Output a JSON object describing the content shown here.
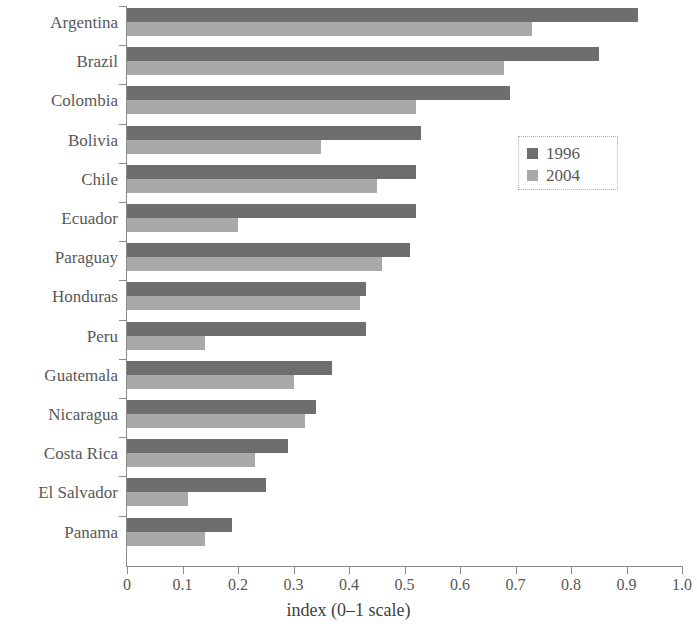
{
  "chart_data": {
    "type": "bar",
    "orientation": "horizontal",
    "title": "",
    "xlabel": "index (0–1 scale)",
    "ylabel": "",
    "xlim": [
      0,
      1.0
    ],
    "grid": false,
    "legend_position": "right-upper",
    "x_ticks": [
      "0",
      "0.1",
      "0.2",
      "0.3",
      "0.4",
      "0.5",
      "0.6",
      "0.7",
      "0.8",
      "0.9",
      "1.0"
    ],
    "x_tick_values": [
      0,
      0.1,
      0.2,
      0.3,
      0.4,
      0.5,
      0.6,
      0.7,
      0.8,
      0.9,
      1.0
    ],
    "categories": [
      "Argentina",
      "Brazil",
      "Colombia",
      "Bolivia",
      "Chile",
      "Ecuador",
      "Paraguay",
      "Honduras",
      "Peru",
      "Guatemala",
      "Nicaragua",
      "Costa Rica",
      "El Salvador",
      "Panama"
    ],
    "series": [
      {
        "name": "1996",
        "color": "#6e6e6e",
        "values": [
          0.92,
          0.85,
          0.69,
          0.53,
          0.52,
          0.52,
          0.51,
          0.43,
          0.43,
          0.37,
          0.34,
          0.29,
          0.25,
          0.19
        ]
      },
      {
        "name": "2004",
        "color": "#a9a9a9",
        "values": [
          0.73,
          0.68,
          0.52,
          0.35,
          0.45,
          0.2,
          0.46,
          0.42,
          0.14,
          0.3,
          0.32,
          0.23,
          0.11,
          0.14
        ]
      }
    ]
  },
  "legend": {
    "entries": [
      {
        "label": "1996",
        "color": "#6e6e6e"
      },
      {
        "label": "2004",
        "color": "#a9a9a9"
      }
    ]
  },
  "axis": {
    "x_title": "index (0–1 scale)"
  }
}
